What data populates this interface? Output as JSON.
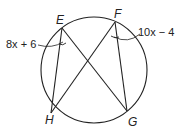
{
  "diagram": {
    "points": {
      "E": {
        "label": "E"
      },
      "F": {
        "label": "F"
      },
      "G": {
        "label": "G"
      },
      "H": {
        "label": "H"
      }
    },
    "angle_labels": {
      "angle_E": "8x + 6",
      "angle_F": "10x − 4"
    },
    "stroke_color": "#222222"
  }
}
